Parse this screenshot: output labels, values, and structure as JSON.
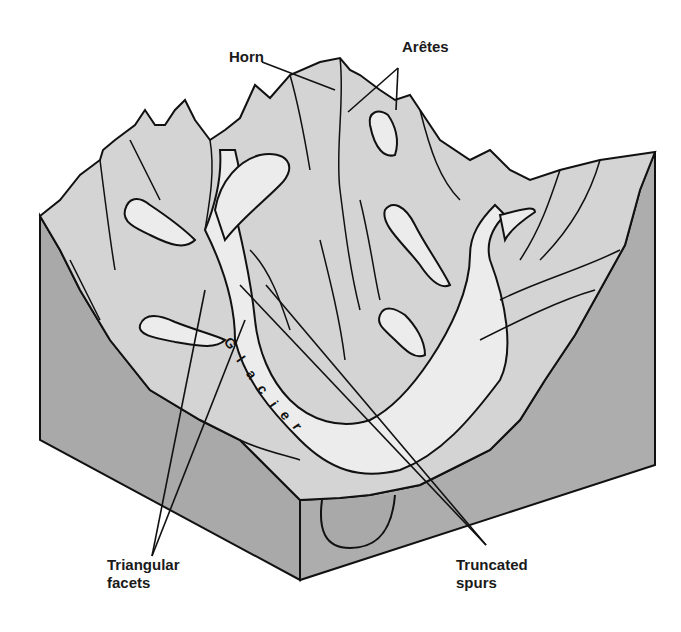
{
  "diagram": {
    "type": "block-diagram",
    "colors": {
      "block_side": "#a9a9a9",
      "block_side_light": "#b5b5b5",
      "terrain": "#d4d4d4",
      "glacier_ice": "#ececec",
      "ink": "#111111",
      "background": "#ffffff"
    },
    "labels": {
      "horn": "Horn",
      "aretes": "Arêtes",
      "triangular_facets": "Triangular\nfacets",
      "truncated_spurs": "Truncated\nspurs"
    },
    "glacier_text": [
      "G",
      "l",
      "a",
      "c",
      "i",
      "e",
      "r"
    ]
  }
}
